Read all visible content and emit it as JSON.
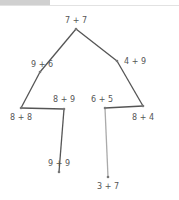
{
  "nodes": [
    {
      "id": "n1",
      "label": "7 + 7",
      "x": 76,
      "y": 29,
      "lx": 76,
      "ly": 23,
      "anchor": "middle"
    },
    {
      "id": "n2",
      "label": "9 + 6",
      "x": 40,
      "y": 72,
      "lx": 42,
      "ly": 67,
      "anchor": "middle"
    },
    {
      "id": "n3",
      "label": "4 + 9",
      "x": 117,
      "y": 61,
      "lx": 124,
      "ly": 64,
      "anchor": "start"
    },
    {
      "id": "n4",
      "label": "8 + 8",
      "x": 21,
      "y": 108,
      "lx": 21,
      "ly": 120,
      "anchor": "middle"
    },
    {
      "id": "n5",
      "label": "8 + 9",
      "x": 64,
      "y": 109,
      "lx": 64,
      "ly": 102,
      "anchor": "middle"
    },
    {
      "id": "n6",
      "label": "6 + 5",
      "x": 105,
      "y": 108,
      "lx": 102,
      "ly": 102,
      "anchor": "middle"
    },
    {
      "id": "n7",
      "label": "8 + 4",
      "x": 143,
      "y": 106,
      "lx": 143,
      "ly": 120,
      "anchor": "middle"
    },
    {
      "id": "n8",
      "label": "9 + 9",
      "x": 59,
      "y": 172,
      "lx": 59,
      "ly": 166,
      "anchor": "middle"
    },
    {
      "id": "n9",
      "label": "3 + 7",
      "x": 108,
      "y": 177,
      "lx": 108,
      "ly": 189,
      "anchor": "middle"
    }
  ],
  "edges": [
    {
      "from": "n1",
      "to": "n2",
      "color": "#555555"
    },
    {
      "from": "n2",
      "to": "n4",
      "color": "#555555"
    },
    {
      "from": "n4",
      "to": "n5",
      "color": "#555555"
    },
    {
      "from": "n5",
      "to": "n8",
      "color": "#555555"
    },
    {
      "from": "n1",
      "to": "n3",
      "color": "#555555"
    },
    {
      "from": "n3",
      "to": "n7",
      "color": "#555555"
    },
    {
      "from": "n7",
      "to": "n6",
      "color": "#555555"
    },
    {
      "from": "n6",
      "to": "n9",
      "color": "#aaaaaa"
    }
  ]
}
